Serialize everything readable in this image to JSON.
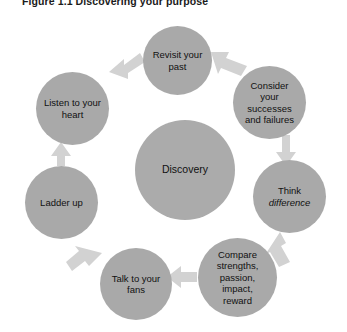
{
  "figure": {
    "label": "Figure 1.1",
    "title": "Discovering your purpose",
    "full_caption": "Figure 1.1 Discovering your purpose"
  },
  "colors": {
    "circle_fill": "#a9a9a9",
    "center_fill": "#ababab",
    "arrow_fill": "#d2d2d2",
    "label_text": "#111111",
    "caption_text": "#1b1b1b",
    "background": "#ffffff"
  },
  "diagram": {
    "type": "cycle",
    "center": {
      "name": "discovery",
      "label": "Discovery"
    },
    "nodes": [
      {
        "name": "revisit-your-past",
        "label": "Revisit your\npast",
        "line1": "Revisit your",
        "line2": "past"
      },
      {
        "name": "consider-successes",
        "label": "Consider your successes and failures",
        "line1": "Consider",
        "line2": "your",
        "line3": "successes",
        "line4": "and failures"
      },
      {
        "name": "think-difference",
        "label": "Think difference",
        "line1": "Think",
        "line2": "difference"
      },
      {
        "name": "compare-strengths",
        "label": "Compare strengths, passion, impact, reward",
        "line1": "Compare",
        "line2": "strengths,",
        "line3": "passion,",
        "line4": "impact,",
        "line5": "reward"
      },
      {
        "name": "talk-to-your-fans",
        "label": "Talk to your fans",
        "line1": "Talk to your",
        "line2": "fans"
      },
      {
        "name": "ladder-up",
        "label": "Ladder up",
        "line1": "Ladder up"
      },
      {
        "name": "listen-to-your-heart",
        "label": "Listen to your heart",
        "line1": "Listen to your",
        "line2": "heart"
      }
    ],
    "arrows": [
      {
        "name": "arrow-revisit-to-consider",
        "from": "revisit-your-past",
        "to": "consider-successes"
      },
      {
        "name": "arrow-consider-to-think",
        "from": "consider-successes",
        "to": "think-difference"
      },
      {
        "name": "arrow-think-to-compare",
        "from": "think-difference",
        "to": "compare-strengths"
      },
      {
        "name": "arrow-compare-to-talk",
        "from": "compare-strengths",
        "to": "talk-to-your-fans"
      },
      {
        "name": "arrow-talk-to-ladder",
        "from": "talk-to-your-fans",
        "to": "ladder-up"
      },
      {
        "name": "arrow-ladder-to-listen",
        "from": "ladder-up",
        "to": "listen-to-your-heart"
      },
      {
        "name": "arrow-listen-to-revisit",
        "from": "listen-to-your-heart",
        "to": "revisit-your-past"
      }
    ]
  }
}
